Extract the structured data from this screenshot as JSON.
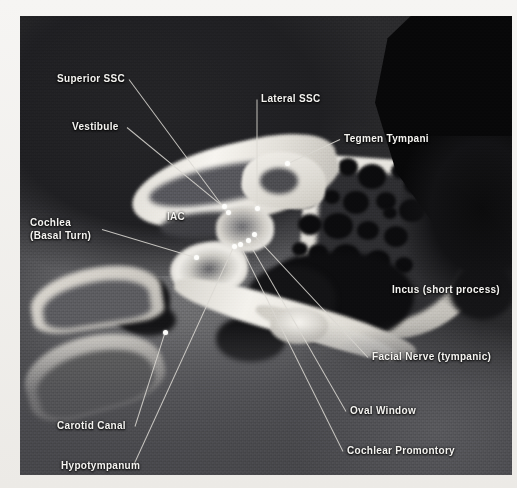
{
  "image": {
    "modality": "CT",
    "region": "Temporal bone, axial section",
    "frame": {
      "left": 20,
      "top": 16,
      "width": 492,
      "height": 459
    }
  },
  "annotations": [
    {
      "id": "superior-ssc",
      "label": "Superior SSC",
      "label_x": 57,
      "label_y": 72,
      "anchor_x": 228,
      "anchor_y": 212,
      "align": "left"
    },
    {
      "id": "vestibule",
      "label": "Vestibule",
      "label_x": 72,
      "label_y": 120,
      "anchor_x": 224,
      "anchor_y": 206,
      "align": "left"
    },
    {
      "id": "lateral-ssc",
      "label": "Lateral SSC",
      "label_x": 261,
      "label_y": 92,
      "anchor_x": 257,
      "anchor_y": 208,
      "align": "left"
    },
    {
      "id": "tegmen-tympani",
      "label": "Tegmen Tympani",
      "label_x": 344,
      "label_y": 132,
      "anchor_x": 287,
      "anchor_y": 163,
      "align": "left"
    },
    {
      "id": "cochlea-basal-turn",
      "label": "Cochlea",
      "label2": "(Basal Turn)",
      "label_x": 30,
      "label_y": 216,
      "anchor_x": 196,
      "anchor_y": 257,
      "align": "left"
    },
    {
      "id": "iac",
      "label": "IAC",
      "label_x": 167,
      "label_y": 210,
      "anchor_x": null,
      "anchor_y": null,
      "align": "left"
    },
    {
      "id": "incus-short-process",
      "label": "Incus (short process)",
      "label_x": 392,
      "label_y": 283,
      "anchor_x": null,
      "anchor_y": null,
      "align": "left"
    },
    {
      "id": "facial-nerve-tympanic",
      "label": "Facial Nerve (tympanic)",
      "label_x": 372,
      "label_y": 350,
      "anchor_x": 254,
      "anchor_y": 234,
      "align": "left"
    },
    {
      "id": "oval-window",
      "label": "Oval Window",
      "label_x": 350,
      "label_y": 404,
      "anchor_x": 248,
      "anchor_y": 240,
      "align": "left"
    },
    {
      "id": "cochlear-promontory",
      "label": "Cochlear Promontory",
      "label_x": 347,
      "label_y": 444,
      "anchor_x": 240,
      "anchor_y": 244,
      "align": "left"
    },
    {
      "id": "carotid-canal",
      "label": "Carotid Canal",
      "label_x": 57,
      "label_y": 419,
      "anchor_x": 165,
      "anchor_y": 332,
      "align": "left"
    },
    {
      "id": "hypotympanum",
      "label": "Hypotympanum",
      "label_x": 61,
      "label_y": 459,
      "anchor_x": 234,
      "anchor_y": 246,
      "align": "left"
    }
  ],
  "air_cells": [
    {
      "x": 318,
      "y": 176,
      "r": 13
    },
    {
      "x": 348,
      "y": 168,
      "r": 10
    },
    {
      "x": 372,
      "y": 178,
      "r": 14
    },
    {
      "x": 400,
      "y": 172,
      "r": 9
    },
    {
      "x": 416,
      "y": 186,
      "r": 12
    },
    {
      "x": 306,
      "y": 200,
      "r": 11
    },
    {
      "x": 332,
      "y": 198,
      "r": 8
    },
    {
      "x": 356,
      "y": 204,
      "r": 13
    },
    {
      "x": 386,
      "y": 202,
      "r": 10
    },
    {
      "x": 412,
      "y": 212,
      "r": 13
    },
    {
      "x": 310,
      "y": 226,
      "r": 12
    },
    {
      "x": 338,
      "y": 228,
      "r": 15
    },
    {
      "x": 368,
      "y": 232,
      "r": 11
    },
    {
      "x": 396,
      "y": 238,
      "r": 12
    },
    {
      "x": 318,
      "y": 254,
      "r": 10
    },
    {
      "x": 346,
      "y": 258,
      "r": 14
    },
    {
      "x": 378,
      "y": 262,
      "r": 12
    },
    {
      "x": 404,
      "y": 266,
      "r": 9
    },
    {
      "x": 336,
      "y": 284,
      "r": 13
    },
    {
      "x": 366,
      "y": 288,
      "r": 11
    },
    {
      "x": 300,
      "y": 250,
      "r": 8
    },
    {
      "x": 390,
      "y": 214,
      "r": 7
    }
  ]
}
